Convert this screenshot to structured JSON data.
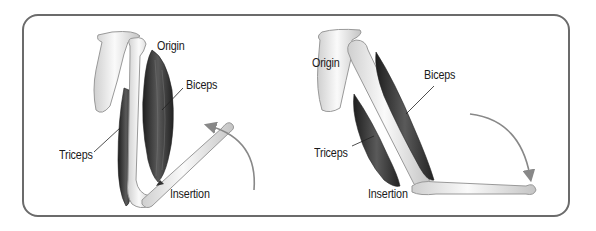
{
  "diagram": {
    "type": "anatomical-muscle-pair",
    "panels": [
      {
        "id": "flexion",
        "labels": {
          "origin": "Origin",
          "biceps": "Biceps",
          "triceps": "Triceps",
          "insertion": "Insertion"
        },
        "motion_arrow": "upward-curved"
      },
      {
        "id": "extension",
        "labels": {
          "origin": "Origin",
          "biceps": "Biceps",
          "triceps": "Triceps",
          "insertion": "Insertion"
        },
        "motion_arrow": "downward-curved"
      }
    ]
  },
  "colors": {
    "frame": "#6b6b6b",
    "bone_fill": "#ececec",
    "bone_stroke": "#9a9a9a",
    "muscle_dark": "#2e2e2e",
    "muscle_mid": "#555555",
    "arrow": "#888888",
    "label_text": "#1a1a1a"
  }
}
